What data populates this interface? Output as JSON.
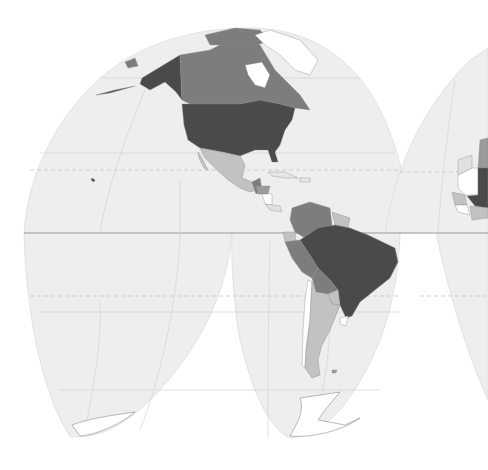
{
  "map": {
    "projection": "interrupted-goode-homolosine",
    "style": "grayscale-choropleth",
    "background": "#ffffff",
    "ocean_fill": "#eeeeee",
    "legend": null
  },
  "color_classes": {
    "darkest": "#4a4a4a",
    "dark": "#7d7d7d",
    "medium": "#9a9a9a",
    "light": "#c2c2c2",
    "none": "#ffffff"
  },
  "regions": [
    {
      "name": "alaska",
      "class": "darkest"
    },
    {
      "name": "canada",
      "class": "dark"
    },
    {
      "name": "greenland",
      "class": "none"
    },
    {
      "name": "united-states",
      "class": "darkest"
    },
    {
      "name": "mexico",
      "class": "light"
    },
    {
      "name": "guatemala",
      "class": "dark"
    },
    {
      "name": "honduras",
      "class": "dark"
    },
    {
      "name": "nicaragua",
      "class": "none"
    },
    {
      "name": "cuba",
      "class": "none"
    },
    {
      "name": "colombia",
      "class": "dark"
    },
    {
      "name": "venezuela",
      "class": "dark"
    },
    {
      "name": "guyana",
      "class": "light"
    },
    {
      "name": "ecuador",
      "class": "light"
    },
    {
      "name": "peru",
      "class": "dark"
    },
    {
      "name": "bolivia",
      "class": "dark"
    },
    {
      "name": "brazil",
      "class": "darkest"
    },
    {
      "name": "paraguay",
      "class": "light"
    },
    {
      "name": "chile",
      "class": "none"
    },
    {
      "name": "argentina",
      "class": "light"
    },
    {
      "name": "uruguay",
      "class": "none"
    },
    {
      "name": "antarctica",
      "class": "none"
    },
    {
      "name": "mauritania",
      "class": "none"
    },
    {
      "name": "mali",
      "class": "darkest"
    },
    {
      "name": "senegal",
      "class": "light"
    },
    {
      "name": "guinea",
      "class": "none"
    },
    {
      "name": "burkina-faso",
      "class": "light"
    },
    {
      "name": "algeria",
      "class": "medium"
    }
  ]
}
